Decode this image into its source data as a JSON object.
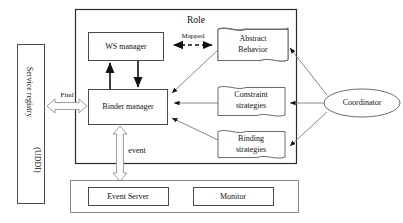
{
  "diagram": {
    "title_label": "Role",
    "service_registry": {
      "line1": "Service  registry",
      "line2": "(UDDI)"
    },
    "nodes": {
      "ws_manager": "WS manager",
      "binder_manager": "Binder manager",
      "abstract_behavior_line1": "Abstract",
      "abstract_behavior_line2": "Behavior",
      "constraint_line1": "Constraint",
      "constraint_line2": "strategies",
      "binding_line1": "Binding",
      "binding_line2": "strategies",
      "coordinator": "Coordinator",
      "event_server": "Event Server",
      "monitor": "Monitor"
    },
    "edge_labels": {
      "mapped": "Mapped",
      "find": "Find",
      "event": "event"
    },
    "colors": {
      "background": "#ffffff",
      "stroke_dark": "#2b2b2b",
      "stroke_mid": "#6b6b6b",
      "stroke_light": "#9a9a9a",
      "text": "#111111"
    }
  }
}
